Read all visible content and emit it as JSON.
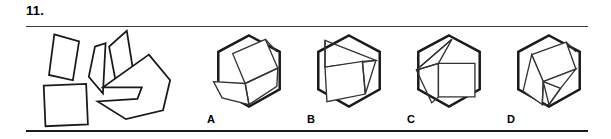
{
  "item": {
    "number": "11.",
    "type": "shape-assembly-multiple-choice"
  },
  "colors": {
    "ink": "#1a1a1a",
    "rule": "#3a3a3a",
    "inner_line": "#333333",
    "background": "#ffffff"
  },
  "stimulus": {
    "name": "scattered-pieces",
    "description": "Five scattered flat puzzle pieces: a square, two narrow slivers, a tall kite, and a large arrow-like polygon",
    "pieces": [
      {
        "name": "square-piece",
        "points": "5,64 53,62 55,108 7,110"
      },
      {
        "name": "narrow-sliver-left",
        "points": "17,6 45,14 38,58 11,52"
      },
      {
        "name": "narrow-sliver-middle",
        "points": "63,20 75,16 72,73 56,54"
      },
      {
        "name": "tall-kite-piece",
        "points": "99,2 106,46 87,62 79,20"
      },
      {
        "name": "large-arrow-piece",
        "points": "124,29 148,58 140,92 98,102 66,82 111,79 116,66 72,66"
      }
    ]
  },
  "options": [
    {
      "label": "A",
      "name": "option-a",
      "hexagon": "50,4 82,21 82,60 50,78 18,60 18,21",
      "inner_shapes": [
        {
          "name": "tilted-square",
          "points": "33,23 67,8 80,38 46,54"
        },
        {
          "name": "lower-trapezoid",
          "points": "13,52 46,54 50,76 22,69"
        },
        {
          "name": "right-wedge",
          "points": "46,54 80,38 79,57 50,76"
        }
      ],
      "inner_lines": [
        {
          "name": "square-to-vertex",
          "points": "67,8 79,21"
        }
      ]
    },
    {
      "label": "B",
      "name": "option-b",
      "hexagon": "50,4 82,21 82,60 50,78 18,60 18,21",
      "inner_shapes": [
        {
          "name": "tilted-square",
          "points": "25,37 64,31 67,65 27,73"
        },
        {
          "name": "upper-sliver",
          "points": "25,9 78,30 25,37"
        },
        {
          "name": "right-wedge",
          "points": "64,31 78,30 67,65"
        }
      ],
      "inner_lines": [
        {
          "name": "left-edge-line",
          "points": "25,9 25,37"
        }
      ]
    },
    {
      "label": "C",
      "name": "option-c",
      "hexagon": "50,4 82,21 82,60 50,78 18,60 18,21",
      "inner_shapes": [
        {
          "name": "upright-square",
          "points": "39,33 77,33 77,68 39,68"
        },
        {
          "name": "left-wedge-upper",
          "points": "53,8 16,40 39,33"
        },
        {
          "name": "left-wedge-lower",
          "points": "16,40 39,33 39,68 32,74"
        }
      ],
      "inner_lines": [
        {
          "name": "wedge-split",
          "points": "16,40 53,8"
        }
      ]
    },
    {
      "label": "D",
      "name": "option-d",
      "hexagon": "50,4 82,21 82,60 50,78 18,60 18,21",
      "inner_shapes": [
        {
          "name": "tilted-square",
          "points": "32,24 68,11 78,39 44,52"
        },
        {
          "name": "lower-left-piece",
          "points": "32,24 44,52 43,76 23,62"
        },
        {
          "name": "lower-right-piece",
          "points": "44,52 78,39 62,59 50,76"
        },
        {
          "name": "narrow-strip",
          "points": "43,76 50,76 62,59 44,52"
        }
      ],
      "inner_lines": [
        {
          "name": "square-to-vertex",
          "points": "68,11 78,21"
        }
      ]
    }
  ]
}
